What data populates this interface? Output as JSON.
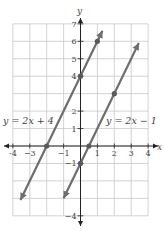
{
  "chart_data": {
    "type": "line",
    "title": "",
    "xlabel": "x",
    "ylabel": "y",
    "xlim": [
      -4,
      4
    ],
    "ylim": [
      -4,
      7
    ],
    "grid": true,
    "x_ticks": [
      -4,
      -3,
      -1,
      1,
      2,
      3,
      4
    ],
    "x_tick_labels": [
      "-4",
      "−3",
      "−1",
      "1",
      "2",
      "3",
      "4"
    ],
    "y_ticks": [
      7,
      6,
      5,
      4,
      2,
      1,
      -1,
      -4
    ],
    "y_tick_labels": [
      "7",
      "6",
      "5",
      "4",
      "2",
      "1",
      "−1",
      "−4"
    ],
    "series": [
      {
        "name": "y = 2x + 4",
        "label": "y = 2x + 4",
        "slope": 2,
        "intercept": 4,
        "from": [
          -3.55,
          -3.1
        ],
        "to": [
          1.3,
          6.6
        ],
        "points": [
          [
            -2,
            0
          ],
          [
            0,
            4
          ],
          [
            1,
            6
          ]
        ]
      },
      {
        "name": "y = 2x − 1",
        "label": "y = 2x − 1",
        "slope": 2,
        "intercept": -1,
        "from": [
          -1.0,
          -3.0
        ],
        "to": [
          3.45,
          5.9
        ],
        "points": [
          [
            0,
            -1
          ],
          [
            0.5,
            0
          ],
          [
            2,
            3
          ]
        ]
      }
    ],
    "colors": {
      "line": "#6e6e6e",
      "grid": "#c8c8c8",
      "axis": "#222222",
      "point": "#5a5a5a"
    }
  }
}
